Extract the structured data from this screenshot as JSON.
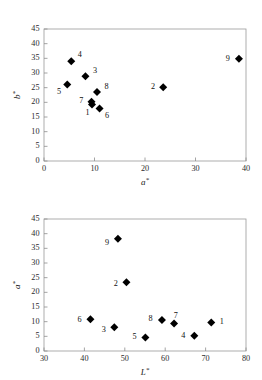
{
  "chart_data": [
    {
      "id": "top",
      "type": "scatter",
      "title": "",
      "xlabel": "a*",
      "ylabel": "b*",
      "xlim": [
        0,
        40
      ],
      "ylim": [
        0,
        45
      ],
      "xticks": [
        0,
        10,
        20,
        30,
        40
      ],
      "yticks": [
        0,
        5,
        10,
        15,
        20,
        25,
        30,
        35,
        40,
        45
      ],
      "grid": false,
      "legend": "none",
      "marker": "filled-diamond",
      "marker_color": "#000000",
      "points": [
        {
          "label": "1",
          "x": 9.5,
          "y": 19.3,
          "label_dx": -0.9,
          "label_dy": -2.9
        },
        {
          "label": "2",
          "x": 23.6,
          "y": 25.1,
          "label_dx": -2.0,
          "label_dy": 0.0
        },
        {
          "label": "3",
          "x": 8.2,
          "y": 28.9,
          "label_dx": 1.9,
          "label_dy": 1.9
        },
        {
          "label": "4",
          "x": 5.4,
          "y": 34.0,
          "label_dx": 1.7,
          "label_dy": 2.0
        },
        {
          "label": "5",
          "x": 4.6,
          "y": 26.1,
          "label_dx": -1.6,
          "label_dy": -2.6
        },
        {
          "label": "6",
          "x": 11.0,
          "y": 17.9,
          "label_dx": 1.5,
          "label_dy": -2.6
        },
        {
          "label": "7",
          "x": 9.4,
          "y": 20.2,
          "label_dx": -2.0,
          "label_dy": 0.2
        },
        {
          "label": "8",
          "x": 10.5,
          "y": 23.5,
          "label_dx": 1.9,
          "label_dy": 1.6
        },
        {
          "label": "9",
          "x": 38.6,
          "y": 34.9,
          "label_dx": -2.2,
          "label_dy": 0.0
        }
      ]
    },
    {
      "id": "bottom",
      "type": "scatter",
      "title": "",
      "xlabel": "L*",
      "ylabel": "a*",
      "xlim": [
        30,
        80
      ],
      "ylim": [
        0,
        45
      ],
      "xticks": [
        30,
        40,
        50,
        60,
        70,
        80
      ],
      "yticks": [
        0,
        5,
        10,
        15,
        20,
        25,
        30,
        35,
        40,
        45
      ],
      "grid": false,
      "legend": "none",
      "marker": "filled-diamond",
      "marker_color": "#000000",
      "points": [
        {
          "label": "1",
          "x": 71.4,
          "y": 9.7,
          "label_dx": 2.6,
          "label_dy": 0.0
        },
        {
          "label": "2",
          "x": 50.4,
          "y": 23.4,
          "label_dx": -2.6,
          "label_dy": -0.7
        },
        {
          "label": "3",
          "x": 47.4,
          "y": 8.1,
          "label_dx": -2.6,
          "label_dy": -0.9
        },
        {
          "label": "4",
          "x": 67.2,
          "y": 5.2,
          "label_dx": -2.7,
          "label_dy": -0.1
        },
        {
          "label": "5",
          "x": 55.1,
          "y": 4.6,
          "label_dx": -2.7,
          "label_dy": 0.2
        },
        {
          "label": "6",
          "x": 41.5,
          "y": 10.8,
          "label_dx": -2.7,
          "label_dy": -0.3
        },
        {
          "label": "7",
          "x": 62.2,
          "y": 9.4,
          "label_dx": 0.4,
          "label_dy": 2.6
        },
        {
          "label": "8",
          "x": 59.2,
          "y": 10.6,
          "label_dx": -2.8,
          "label_dy": 0.1
        },
        {
          "label": "9",
          "x": 48.3,
          "y": 38.3,
          "label_dx": -2.7,
          "label_dy": -1.6
        }
      ]
    }
  ]
}
